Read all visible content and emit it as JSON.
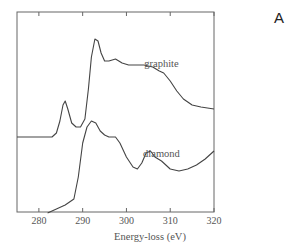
{
  "panel_label": "A",
  "chart_data": {
    "type": "line",
    "title": "",
    "xlabel": "Energy-loss (eV)",
    "ylabel": "",
    "xlim": [
      275,
      320
    ],
    "xticks": [
      280,
      290,
      300,
      310,
      320
    ],
    "ylim": [
      0,
      1
    ],
    "grid": false,
    "legend": "inline labels",
    "series": [
      {
        "name": "graphite",
        "label_pos": {
          "x": 308,
          "y": 0.73
        },
        "x": [
          275,
          283,
          284,
          284.8,
          285.5,
          286,
          286.6,
          287.5,
          288.5,
          289.5,
          290.5,
          291.3,
          292,
          292.8,
          293.5,
          294.2,
          295,
          296,
          297.5,
          299,
          300.5,
          302,
          304,
          306,
          307.5,
          308.5,
          310,
          311.5,
          313,
          315,
          317,
          320
        ],
        "y": [
          0.38,
          0.38,
          0.4,
          0.46,
          0.54,
          0.56,
          0.52,
          0.45,
          0.43,
          0.43,
          0.47,
          0.62,
          0.78,
          0.87,
          0.86,
          0.8,
          0.76,
          0.76,
          0.77,
          0.75,
          0.74,
          0.74,
          0.74,
          0.73,
          0.71,
          0.7,
          0.66,
          0.61,
          0.57,
          0.54,
          0.53,
          0.52
        ]
      },
      {
        "name": "diamond",
        "label_pos": {
          "x": 308,
          "y": 0.28
        },
        "x": [
          282,
          284,
          286,
          288,
          289,
          290,
          291,
          292,
          293,
          294,
          295,
          296,
          297.5,
          298.5,
          300,
          301.5,
          302.5,
          303.5,
          304.5,
          305.5,
          306.5,
          308,
          310,
          312,
          314,
          316,
          318,
          320
        ],
        "y": [
          0.0,
          0.02,
          0.04,
          0.07,
          0.18,
          0.35,
          0.43,
          0.46,
          0.45,
          0.41,
          0.39,
          0.38,
          0.38,
          0.35,
          0.28,
          0.23,
          0.22,
          0.25,
          0.3,
          0.31,
          0.28,
          0.26,
          0.22,
          0.21,
          0.22,
          0.24,
          0.27,
          0.31
        ]
      }
    ]
  }
}
